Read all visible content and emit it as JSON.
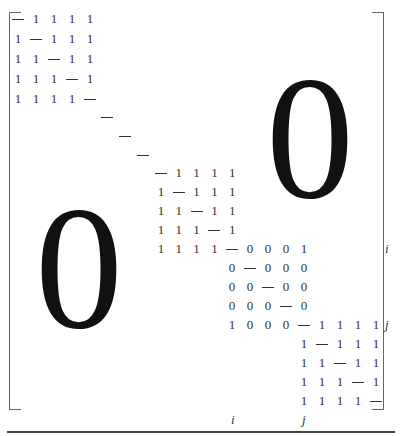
{
  "matrix": {
    "blocks": [
      {
        "name": "block-1",
        "origin": [
          18,
          19
        ],
        "step": [
          18,
          20
        ],
        "rows": [
          [
            "—",
            "1",
            "1",
            "1",
            "1"
          ],
          [
            "1",
            "—",
            "1",
            "1",
            "1"
          ],
          [
            "1",
            "1",
            "—",
            "1",
            "1"
          ],
          [
            "1",
            "1",
            "1",
            "—",
            "1"
          ],
          [
            "1",
            "1",
            "1",
            "1",
            "—"
          ]
        ]
      },
      {
        "name": "block-2",
        "origin": [
          161,
          173
        ],
        "step": [
          17.8,
          19
        ],
        "rows": [
          [
            "—",
            "1",
            "1",
            "1",
            "1"
          ],
          [
            "1",
            "—",
            "1",
            "1",
            "1"
          ],
          [
            "1",
            "1",
            "—",
            "1",
            "1"
          ],
          [
            "1",
            "1",
            "1",
            "—",
            "1"
          ],
          [
            "1",
            "1",
            "1",
            "1",
            "—"
          ]
        ]
      },
      {
        "name": "block-3",
        "origin": [
          232,
          249
        ],
        "step": [
          18,
          19
        ],
        "rows": [
          [
            "—",
            "0",
            "0",
            "0",
            "1"
          ],
          [
            "0",
            "—",
            "0",
            "0",
            "0"
          ],
          [
            "0",
            "0",
            "—",
            "0",
            "0"
          ],
          [
            "0",
            "0",
            "0",
            "—",
            "0"
          ],
          [
            "1",
            "0",
            "0",
            "0",
            "—"
          ]
        ]
      },
      {
        "name": "block-4",
        "origin": [
          304,
          325
        ],
        "step": [
          18,
          19
        ],
        "rows": [
          [
            "—",
            "1",
            "1",
            "1",
            "1"
          ],
          [
            "1",
            "—",
            "1",
            "1",
            "1"
          ],
          [
            "1",
            "1",
            "—",
            "1",
            "1"
          ],
          [
            "1",
            "1",
            "1",
            "—",
            "1"
          ],
          [
            "1",
            "1",
            "1",
            "1",
            "—"
          ]
        ]
      }
    ],
    "diagonal_dashes": [
      [
        107,
        117
      ],
      [
        125,
        136
      ],
      [
        143,
        155
      ]
    ],
    "zero_upper": "0",
    "zero_lower": "0",
    "row_labels": [
      {
        "text": "i",
        "x": 388,
        "y": 249
      },
      {
        "text": "j",
        "x": 388,
        "y": 325
      }
    ],
    "col_labels": [
      {
        "text": "i",
        "x": 234,
        "y": 420
      },
      {
        "text": "j",
        "x": 305,
        "y": 420
      }
    ]
  }
}
